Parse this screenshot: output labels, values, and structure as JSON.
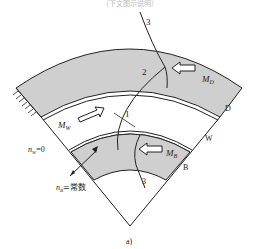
{
  "header": {
    "caption_top": "（下文图示说明）"
  },
  "labels": {
    "line1": "1",
    "line2": "2",
    "line3_top": "3",
    "line3_bottom": "3",
    "md": "M",
    "md_sub": "D",
    "mw": "M",
    "mw_sub": "W",
    "mb": "M",
    "mb_sub": "B",
    "d": "D",
    "w": "W",
    "b": "B",
    "nw": "n",
    "nw_sub": "W",
    "nw_val": "=0",
    "nb": "n",
    "nb_sub": "B",
    "nb_val": "=常数",
    "figure": "a)"
  },
  "colors": {
    "fill": "#cfcfcf",
    "stroke": "#222222"
  }
}
